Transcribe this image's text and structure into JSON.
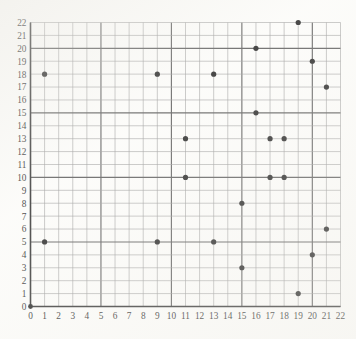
{
  "chart_data": {
    "type": "scatter",
    "title": "",
    "subtitle": "",
    "xlabel": "",
    "ylabel": "",
    "xlim": [
      0,
      22
    ],
    "ylim": [
      0,
      22
    ],
    "grid": true,
    "legend": null,
    "x_ticks": [
      0,
      1,
      2,
      3,
      4,
      5,
      6,
      7,
      8,
      9,
      10,
      11,
      12,
      13,
      14,
      15,
      16,
      17,
      18,
      19,
      20,
      21,
      22
    ],
    "y_ticks": [
      0,
      1,
      2,
      3,
      4,
      5,
      6,
      7,
      8,
      9,
      10,
      11,
      12,
      13,
      14,
      15,
      16,
      17,
      18,
      19,
      20,
      21,
      22
    ],
    "x_tick_labels": [
      "0",
      "1",
      "2",
      "3",
      "4",
      "5",
      "6",
      "7",
      "8",
      "9",
      "10",
      "11",
      "12",
      "13",
      "14",
      "15",
      "16",
      "17",
      "18",
      "19",
      "20",
      "21",
      "22"
    ],
    "y_tick_labels": [
      "0",
      "1",
      "2",
      "3",
      "4",
      "5",
      "6",
      "7",
      "8",
      "9",
      "10",
      "11",
      "12",
      "13",
      "14",
      "15",
      "16",
      "17",
      "18",
      "19",
      "20",
      "21",
      "22"
    ],
    "major_grid_step": 5,
    "point_color": "#0d0d0d",
    "point_radius": 2.6,
    "points": [
      {
        "x": 1,
        "y": 18
      },
      {
        "x": 1,
        "y": 5
      },
      {
        "x": 9,
        "y": 18
      },
      {
        "x": 9,
        "y": 5
      },
      {
        "x": 11,
        "y": 13
      },
      {
        "x": 11,
        "y": 10
      },
      {
        "x": 13,
        "y": 18
      },
      {
        "x": 13,
        "y": 5
      },
      {
        "x": 15,
        "y": 3
      },
      {
        "x": 15,
        "y": 8
      },
      {
        "x": 16,
        "y": 15
      },
      {
        "x": 16,
        "y": 20
      },
      {
        "x": 17,
        "y": 13
      },
      {
        "x": 17,
        "y": 10
      },
      {
        "x": 18,
        "y": 13
      },
      {
        "x": 18,
        "y": 10
      },
      {
        "x": 19,
        "y": 22
      },
      {
        "x": 19,
        "y": 1
      },
      {
        "x": 20,
        "y": 19
      },
      {
        "x": 20,
        "y": 4
      },
      {
        "x": 21,
        "y": 17
      },
      {
        "x": 21,
        "y": 6
      }
    ],
    "series": [
      {
        "name": "series-1",
        "x": [
          1,
          1,
          9,
          9,
          11,
          11,
          13,
          13,
          15,
          15,
          16,
          16,
          17,
          17,
          18,
          18,
          19,
          19,
          20,
          20,
          21,
          21
        ],
        "y": [
          18,
          5,
          18,
          5,
          13,
          10,
          18,
          5,
          3,
          8,
          15,
          20,
          13,
          10,
          13,
          10,
          22,
          1,
          19,
          4,
          17,
          6
        ]
      }
    ]
  }
}
